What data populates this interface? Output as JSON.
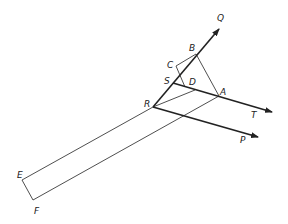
{
  "diagram": {
    "type": "geometric-construction",
    "points": {
      "Q": {
        "label": "Q",
        "x": 219,
        "y": 28
      },
      "B": {
        "label": "B",
        "x": 196,
        "y": 54
      },
      "C": {
        "label": "C",
        "x": 176,
        "y": 66
      },
      "S": {
        "label": "S",
        "x": 173,
        "y": 83
      },
      "D": {
        "label": "D",
        "x": 185,
        "y": 87
      },
      "A": {
        "label": "A",
        "x": 219,
        "y": 96
      },
      "R": {
        "label": "R",
        "x": 153,
        "y": 107
      },
      "T": {
        "label": "T",
        "x": 272,
        "y": 112
      },
      "P": {
        "label": "P",
        "x": 258,
        "y": 137
      },
      "E": {
        "label": "E",
        "x": 22,
        "y": 180
      },
      "F": {
        "label": "F",
        "x": 33,
        "y": 200
      }
    },
    "labels": [
      "Q",
      "B",
      "C",
      "S",
      "D",
      "A",
      "R",
      "T",
      "P",
      "E",
      "F"
    ],
    "rays": [
      "RQ",
      "ST",
      "RP"
    ],
    "segments": [
      "BA",
      "BC",
      "CD",
      "RA",
      "RE",
      "EF",
      "FA"
    ],
    "colors": {
      "stroke": "#222222",
      "background": "#ffffff"
    }
  }
}
